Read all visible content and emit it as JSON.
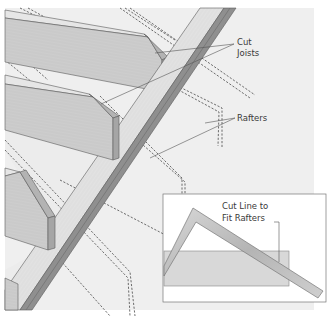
{
  "diagram": {
    "type": "technical-illustration",
    "labels": {
      "cut_joists": [
        "Cut",
        "Joists"
      ],
      "rafters": "Rafters",
      "inset_caption": [
        "Cut Line to",
        "Fit Rafters"
      ]
    },
    "colors": {
      "background": "#efefef",
      "page": "#ffffff",
      "joist_face": "#cfcfcf",
      "joist_top": "#e4e4e4",
      "joist_end": "#a9a9a9",
      "plate_top": "#e2e2e2",
      "plate_side": "#8f8f8f",
      "dash_line": "#4a4a4a",
      "inset_board": "#d6d6d6",
      "square_tool": "#c2c2c2",
      "text": "#3a3a3a"
    }
  }
}
